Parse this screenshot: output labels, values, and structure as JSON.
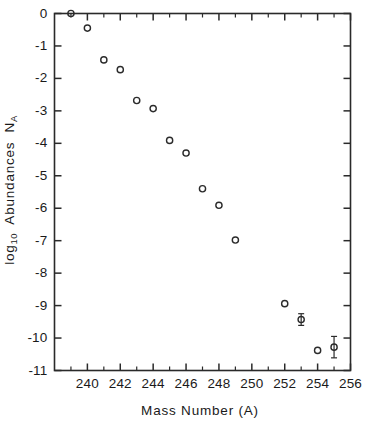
{
  "chart_data": {
    "type": "scatter",
    "title": "",
    "xlabel": "Mass Number (A)",
    "ylabel_main": "Abundances",
    "ylabel_prefix": "log",
    "ylabel_prefix_sub": "10",
    "ylabel_symbol": "N",
    "ylabel_symbol_sub": "A",
    "ylabel_full": "log10 Abundances NA",
    "xlim": [
      238,
      256
    ],
    "ylim": [
      -11,
      0
    ],
    "grid": false,
    "legend": "none",
    "marker_style": "open-circle",
    "x_major_ticks": [
      240,
      242,
      244,
      246,
      248,
      250,
      252,
      254,
      256
    ],
    "x_major_tick_labels": [
      "240",
      "242",
      "244",
      "246",
      "248",
      "250",
      "252",
      "254",
      "256"
    ],
    "x_minor_ticks": [
      239,
      241,
      243,
      245,
      247,
      249,
      251,
      253,
      255
    ],
    "y_major_ticks": [
      0,
      -1,
      -2,
      -3,
      -4,
      -5,
      -6,
      -7,
      -8,
      -9,
      -10,
      -11
    ],
    "y_major_tick_labels": [
      "0",
      "-1",
      "-2",
      "-3",
      "-4",
      "-5",
      "-6",
      "-7",
      "-8",
      "-9",
      "-10",
      "-11"
    ],
    "x": [
      239,
      240,
      241,
      242,
      243,
      244,
      245,
      246,
      247,
      248,
      249,
      252,
      253,
      254,
      255
    ],
    "y": [
      0.0,
      -0.45,
      -1.43,
      -1.73,
      -2.68,
      -2.93,
      -3.91,
      -4.3,
      -5.4,
      -5.91,
      -6.98,
      -8.94,
      -9.43,
      -10.38,
      -10.28
    ],
    "points": [
      {
        "x": 239,
        "y": 0.0,
        "yerr": 0
      },
      {
        "x": 240,
        "y": -0.45,
        "yerr": 0
      },
      {
        "x": 241,
        "y": -1.43,
        "yerr": 0
      },
      {
        "x": 242,
        "y": -1.73,
        "yerr": 0
      },
      {
        "x": 243,
        "y": -2.68,
        "yerr": 0
      },
      {
        "x": 244,
        "y": -2.93,
        "yerr": 0
      },
      {
        "x": 245,
        "y": -3.91,
        "yerr": 0
      },
      {
        "x": 246,
        "y": -4.3,
        "yerr": 0
      },
      {
        "x": 247,
        "y": -5.4,
        "yerr": 0
      },
      {
        "x": 248,
        "y": -5.91,
        "yerr": 0
      },
      {
        "x": 249,
        "y": -6.98,
        "yerr": 0
      },
      {
        "x": 252,
        "y": -8.94,
        "yerr": 0
      },
      {
        "x": 253,
        "y": -9.43,
        "yerr": 0.18
      },
      {
        "x": 254,
        "y": -10.38,
        "yerr": 0
      },
      {
        "x": 255,
        "y": -10.28,
        "yerr": 0.33
      }
    ]
  }
}
